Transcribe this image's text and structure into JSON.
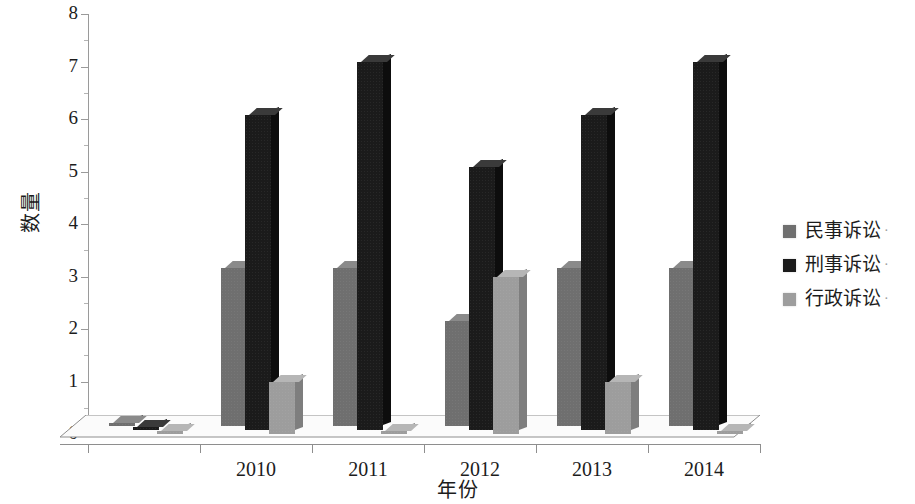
{
  "chart_data": {
    "type": "bar",
    "title": "",
    "xlabel": "年份",
    "ylabel": "数量",
    "categories": [
      "",
      "2010",
      "2011",
      "2012",
      "2013",
      "2014"
    ],
    "tick_labels_x": [
      "2010",
      "2011",
      "2012",
      "2013",
      "2014"
    ],
    "tick_labels_y": [
      "0",
      "1",
      "2",
      "3",
      "4",
      "5",
      "6",
      "7",
      "8"
    ],
    "ylim": [
      0,
      8
    ],
    "ytick_step": 1,
    "yminor_step": 0.5,
    "grid": false,
    "legend_position": "right",
    "style": "3d-clustered-column-grayscale",
    "series": [
      {
        "name": "民事诉讼",
        "color": "#6f6f6f",
        "values": [
          0,
          3,
          3,
          2,
          3,
          3
        ]
      },
      {
        "name": "刑事诉讼",
        "color": "#1b1b1b",
        "values": [
          0,
          6,
          7,
          5,
          6,
          7
        ]
      },
      {
        "name": "行政诉讼",
        "color": "#9d9d9d",
        "values": [
          0,
          1,
          0,
          3,
          1,
          0
        ]
      }
    ]
  },
  "axes": {
    "y_title": "数量",
    "x_title": "年份",
    "y_ticks": [
      {
        "value": 8,
        "label": "8"
      },
      {
        "value": 7,
        "label": "7"
      },
      {
        "value": 6,
        "label": "6"
      },
      {
        "value": 5,
        "label": "5"
      },
      {
        "value": 4,
        "label": "4"
      },
      {
        "value": 3,
        "label": "3"
      },
      {
        "value": 2,
        "label": "2"
      },
      {
        "value": 1,
        "label": "1"
      },
      {
        "value": 0,
        "label": "0"
      }
    ],
    "x_ticks": [
      {
        "label": "2010"
      },
      {
        "label": "2011"
      },
      {
        "label": "2012"
      },
      {
        "label": "2013"
      },
      {
        "label": "2014"
      }
    ]
  },
  "legend": {
    "items": [
      {
        "label": "民事诉讼",
        "color": "#6f6f6f",
        "trailing": "·"
      },
      {
        "label": "刑事诉讼",
        "color": "#1b1b1b",
        "trailing": "·"
      },
      {
        "label": "行政诉讼",
        "color": "#9d9d9d",
        "trailing": "·"
      }
    ]
  },
  "colors": {
    "background": "#ffffff",
    "axis": "#9a9a9a",
    "text": "#1c1c1c",
    "floor": "#fbfbfb",
    "floor_edge": "#8e8e8e"
  }
}
